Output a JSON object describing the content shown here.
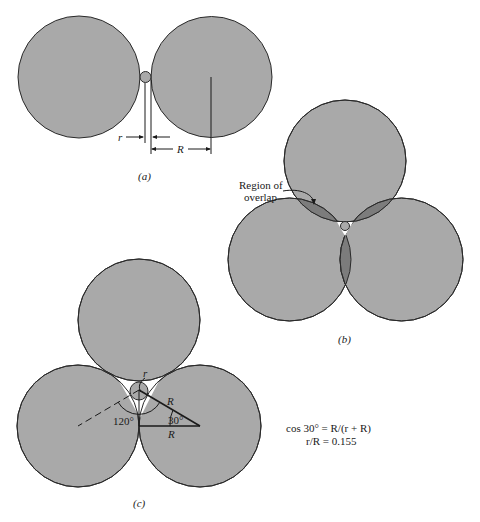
{
  "figure": {
    "panel_a": {
      "caption": "(a)",
      "label_r": "r",
      "label_R": "R"
    },
    "panel_b": {
      "caption": "(b)",
      "callout_line1": "Region of",
      "callout_line2": "overlap"
    },
    "panel_c": {
      "caption": "(c)",
      "label_r": "r",
      "label_R_hyp": "R",
      "label_R_base": "R",
      "angle_120": "120°",
      "angle_30": "30°",
      "equation_1": "cos 30° = R/(r + R)",
      "equation_2": "r/R = 0.155"
    },
    "colors": {
      "disc_fill": "#a9a9a9",
      "overlap_fill": "#7c7c7c",
      "stroke": "#2a2a2a"
    }
  }
}
